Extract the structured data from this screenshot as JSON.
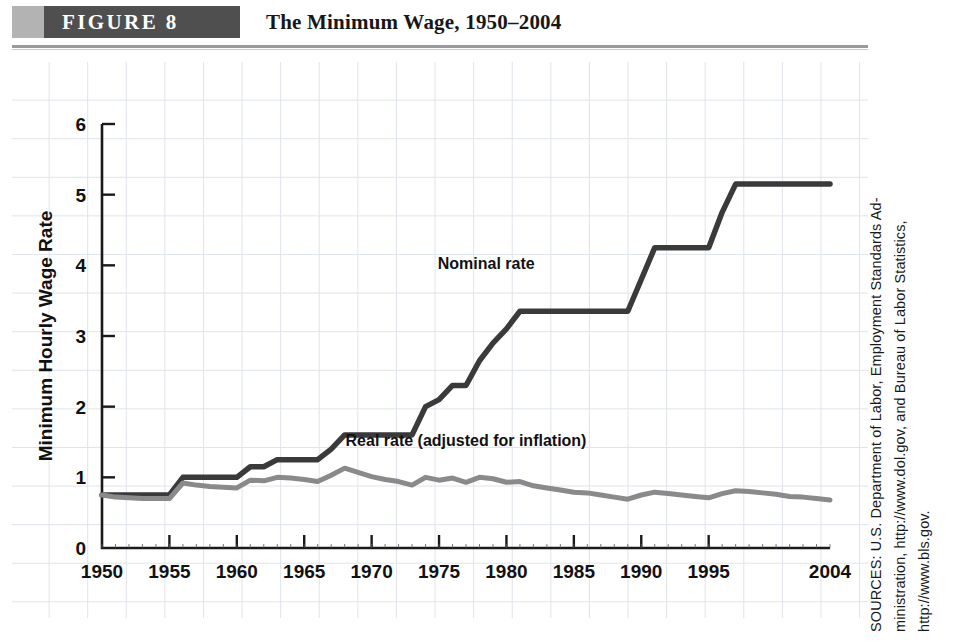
{
  "header": {
    "banner_label": "FIGURE  8",
    "title": "The Minimum Wage, 1950–2004",
    "banner_color": "#4f4f4f",
    "banner_tab_color": "#b3b3b3"
  },
  "source": {
    "lines": [
      "SOURCES: U.S. Department of Labor, Employment Standards Ad-",
      "ministration, http://www.dol.gov, and Bureau of Labor Statistics,",
      "http://www.bls.gov."
    ]
  },
  "chart_data": {
    "type": "line",
    "title": "The Minimum Wage, 1950–2004",
    "xlabel": "",
    "ylabel": "Minimum Hourly Wage Rate",
    "xlim": [
      1950,
      2004
    ],
    "ylim": [
      0,
      6
    ],
    "ytick_labels": [
      "0",
      "1",
      "2",
      "3",
      "4",
      "5",
      "6"
    ],
    "ytick_values": [
      0,
      1,
      2,
      3,
      4,
      5,
      6
    ],
    "xtick_labels": [
      "1950",
      "1955",
      "1960",
      "1965",
      "1970",
      "1975",
      "1980",
      "1985",
      "1990",
      "1995",
      "2004"
    ],
    "xtick_values": [
      1950,
      1955,
      1960,
      1965,
      1970,
      1975,
      1980,
      1985,
      1990,
      1995,
      2004
    ],
    "grid": true,
    "legend_position": "inline-annotation",
    "annotations": [
      {
        "text": "Nominal rate",
        "x": 1978.5,
        "y": 3.95,
        "name": "nominal-rate-annotation"
      },
      {
        "text": "Real rate (adjusted for inflation)",
        "x": 1977.0,
        "y": 1.45,
        "name": "real-rate-annotation"
      }
    ],
    "series": [
      {
        "name": "Nominal rate",
        "color": "#3a3a3a",
        "width": 5.5,
        "x": [
          1950,
          1951,
          1952,
          1953,
          1954,
          1955,
          1956,
          1957,
          1958,
          1959,
          1960,
          1961,
          1962,
          1963,
          1964,
          1965,
          1966,
          1967,
          1968,
          1969,
          1970,
          1971,
          1972,
          1973,
          1974,
          1975,
          1976,
          1977,
          1978,
          1979,
          1980,
          1981,
          1982,
          1983,
          1984,
          1985,
          1986,
          1987,
          1988,
          1989,
          1990,
          1991,
          1992,
          1993,
          1994,
          1995,
          1996,
          1997,
          1998,
          1999,
          2000,
          2001,
          2002,
          2003,
          2004
        ],
        "values": [
          0.75,
          0.75,
          0.75,
          0.75,
          0.75,
          0.75,
          1.0,
          1.0,
          1.0,
          1.0,
          1.0,
          1.15,
          1.15,
          1.25,
          1.25,
          1.25,
          1.25,
          1.4,
          1.6,
          1.6,
          1.6,
          1.6,
          1.6,
          1.6,
          2.0,
          2.1,
          2.3,
          2.3,
          2.65,
          2.9,
          3.1,
          3.35,
          3.35,
          3.35,
          3.35,
          3.35,
          3.35,
          3.35,
          3.35,
          3.35,
          3.8,
          4.25,
          4.25,
          4.25,
          4.25,
          4.25,
          4.75,
          5.15,
          5.15,
          5.15,
          5.15,
          5.15,
          5.15,
          5.15,
          5.15
        ]
      },
      {
        "name": "Real rate (adjusted for inflation)",
        "color": "#8a8a8a",
        "width": 5.0,
        "x": [
          1950,
          1951,
          1952,
          1953,
          1954,
          1955,
          1956,
          1957,
          1958,
          1959,
          1960,
          1961,
          1962,
          1963,
          1964,
          1965,
          1966,
          1967,
          1968,
          1969,
          1970,
          1971,
          1972,
          1973,
          1974,
          1975,
          1976,
          1977,
          1978,
          1979,
          1980,
          1981,
          1982,
          1983,
          1984,
          1985,
          1986,
          1987,
          1988,
          1989,
          1990,
          1991,
          1992,
          1993,
          1994,
          1995,
          1996,
          1997,
          1998,
          1999,
          2000,
          2001,
          2002,
          2003,
          2004
        ],
        "values": [
          0.75,
          0.72,
          0.71,
          0.7,
          0.7,
          0.7,
          0.92,
          0.89,
          0.87,
          0.86,
          0.85,
          0.96,
          0.95,
          1.0,
          0.99,
          0.97,
          0.94,
          1.03,
          1.13,
          1.07,
          1.01,
          0.97,
          0.94,
          0.89,
          1.0,
          0.96,
          0.99,
          0.93,
          1.0,
          0.98,
          0.93,
          0.94,
          0.88,
          0.85,
          0.82,
          0.79,
          0.78,
          0.75,
          0.72,
          0.69,
          0.75,
          0.79,
          0.77,
          0.75,
          0.73,
          0.71,
          0.77,
          0.81,
          0.8,
          0.78,
          0.76,
          0.73,
          0.72,
          0.7,
          0.68
        ]
      }
    ]
  }
}
